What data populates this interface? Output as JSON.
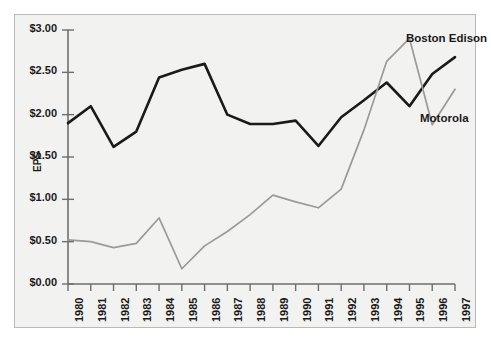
{
  "chart_data": {
    "type": "line",
    "title": "",
    "xlabel": "",
    "ylabel": "EPS",
    "ylim": [
      0.0,
      3.0
    ],
    "ytick_values": [
      0.0,
      0.5,
      1.0,
      1.5,
      2.0,
      2.5,
      3.0
    ],
    "ytick_labels": [
      "$0.00",
      "$0.50",
      "$1.00",
      "$1.50",
      "$2.00",
      "$2.50",
      "$3.00"
    ],
    "grid": false,
    "legend_position": "inline-right",
    "categories": [
      "1980",
      "1981",
      "1982",
      "1983",
      "1984",
      "1985",
      "1986",
      "1987",
      "1988",
      "1989",
      "1990",
      "1991",
      "1992",
      "1993",
      "1994",
      "1995",
      "1996",
      "1997"
    ],
    "series": [
      {
        "name": "Boston Edison",
        "color": "#1a1a1a",
        "values": [
          1.9,
          2.1,
          1.62,
          1.8,
          2.44,
          2.53,
          2.6,
          2.0,
          1.89,
          1.89,
          1.93,
          1.63,
          1.97,
          2.17,
          2.38,
          2.1,
          2.48,
          2.68
        ]
      },
      {
        "name": "Motorola",
        "color": "#9a9a9a",
        "values": [
          0.52,
          0.5,
          0.43,
          0.48,
          0.78,
          0.18,
          0.45,
          0.62,
          0.82,
          1.05,
          0.97,
          0.9,
          1.12,
          1.82,
          2.63,
          2.9,
          1.88,
          2.3
        ]
      }
    ],
    "annotations": [
      {
        "name": "boston-edison-label",
        "text": "Boston Edison"
      },
      {
        "name": "motorola-label",
        "text": "Motorola"
      }
    ]
  }
}
